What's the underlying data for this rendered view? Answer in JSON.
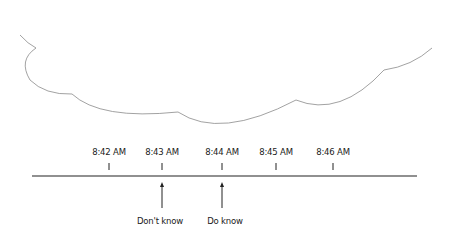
{
  "diagram": {
    "type": "timeline",
    "cloud": {
      "shape": "cloud-bottom-outline",
      "stroke": "#888888"
    },
    "timeline": {
      "line_color": "#222222",
      "ticks": [
        {
          "label": "8:42 AM",
          "x": 109
        },
        {
          "label": "8:43 AM",
          "x": 162
        },
        {
          "label": "8:44 AM",
          "x": 222
        },
        {
          "label": "8:45 AM",
          "x": 276
        },
        {
          "label": "8:46 AM",
          "x": 333
        }
      ],
      "events": [
        {
          "label": "Don't know",
          "x": 162
        },
        {
          "label": "Do know",
          "x": 222
        }
      ]
    }
  }
}
